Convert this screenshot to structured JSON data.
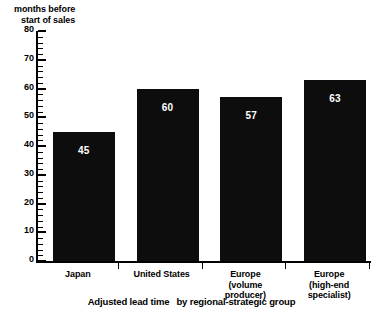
{
  "chart_data": {
    "type": "bar",
    "title_part1": "Adjusted lead time",
    "title_part2": "by regional-strategic group",
    "xlabel": "",
    "ylabel": "months before start of sales",
    "ylabel_line1": "months before",
    "ylabel_line2": "start of sales",
    "categories": [
      "Japan",
      "United States",
      "Europe (volume producer)",
      "Europe (high-end specialist)"
    ],
    "category_lines": [
      [
        "Japan"
      ],
      [
        "United States"
      ],
      [
        "Europe",
        "(volume",
        "producer)"
      ],
      [
        "Europe",
        "(high-end",
        "specialist)"
      ]
    ],
    "values": [
      45,
      60,
      57,
      63
    ],
    "value_labels": [
      "45",
      "60",
      "57",
      "63"
    ],
    "ylim": [
      0,
      80
    ],
    "ytick_labels": [
      "0",
      "10",
      "20",
      "30",
      "40",
      "50",
      "60",
      "70",
      "80"
    ],
    "ytick_values": [
      0,
      10,
      20,
      30,
      40,
      50,
      60,
      70,
      80
    ],
    "yminor_step": 2,
    "grid": false,
    "legend": "none",
    "bar_color": "#0d0d0d",
    "value_label_color": "#ffffff",
    "axis_color": "#000000",
    "background_color": "#ffffff"
  }
}
